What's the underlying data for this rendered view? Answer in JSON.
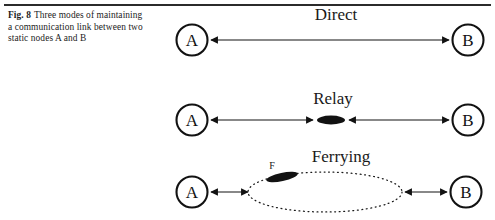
{
  "figure": {
    "caption": {
      "label": "Fig. 8",
      "text": "Three modes of maintaining a communication link between two static nodes A and B"
    },
    "colors": {
      "ink": "#121212",
      "rule": "#2b2b2b",
      "paper": "#ffffff"
    },
    "rows": [
      {
        "id": "direct",
        "title": "Direct",
        "left_node": "A",
        "right_node": "B",
        "middle_node": "",
        "middle_node_label": "",
        "link_style": "double-headed-arrow"
      },
      {
        "id": "relay",
        "title": "Relay",
        "left_node": "A",
        "right_node": "B",
        "middle_node": "relay-node",
        "middle_node_label": "",
        "link_style": "two-double-headed-arrows"
      },
      {
        "id": "ferrying",
        "title": "Ferrying",
        "left_node": "A",
        "right_node": "B",
        "middle_node": "ferry-orbit",
        "middle_node_label": "F",
        "link_style": "two-short-double-headed-arrows"
      }
    ]
  }
}
